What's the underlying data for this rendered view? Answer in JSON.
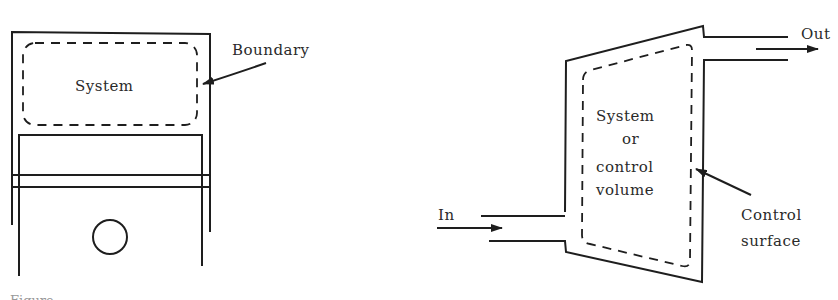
{
  "left_diagram": {
    "system_label": "System",
    "boundary_label": "Boundary"
  },
  "right_diagram": {
    "cv_label_line1": "System",
    "cv_label_line2": "or",
    "cv_label_line3": "control",
    "cv_label_line4": "volume",
    "in_label": "In",
    "out_label": "Out",
    "surface_label_line1": "Control",
    "surface_label_line2": "surface"
  },
  "caption": {
    "text": "Figure"
  },
  "colors": {
    "ink": "#1e1e1e",
    "background": "#ffffff"
  }
}
